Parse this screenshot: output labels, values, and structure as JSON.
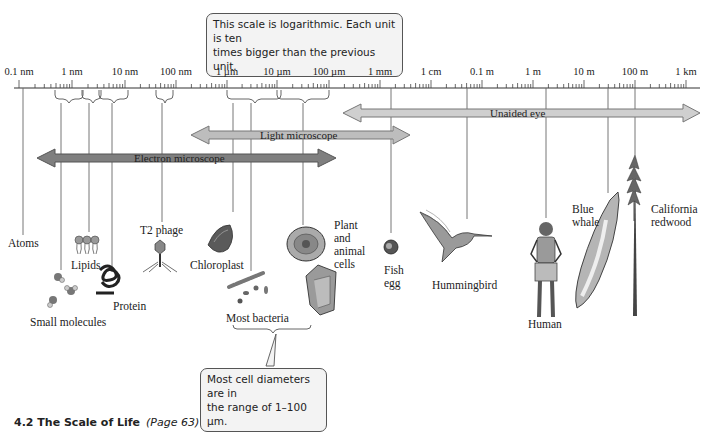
{
  "title_callout": "This scale is logarithmic. Each unit is ten times bigger than the previous unit.",
  "title_callout_lines": [
    "This scale is logarithmic. Each unit is ten",
    "times bigger than the previous unit."
  ],
  "scale": {
    "ticks": [
      {
        "label": "0.1 nm",
        "x": 19
      },
      {
        "label": "1 nm",
        "x": 72
      },
      {
        "label": "10 nm",
        "x": 125
      },
      {
        "label": "100 nm",
        "x": 176
      },
      {
        "label": "1 µm",
        "x": 227
      },
      {
        "label": "10 µm",
        "x": 277
      },
      {
        "label": "100 µm",
        "x": 329
      },
      {
        "label": "1 mm",
        "x": 380
      },
      {
        "label": "1 cm",
        "x": 431
      },
      {
        "label": "0.1 m",
        "x": 482
      },
      {
        "label": "1 m",
        "x": 533
      },
      {
        "label": "10 m",
        "x": 584
      },
      {
        "label": "100 m",
        "x": 635
      },
      {
        "label": "1 km",
        "x": 686
      }
    ]
  },
  "ranges": [
    {
      "label": "Unaided eye",
      "color": "#c8c8c8"
    },
    {
      "label": "Light microscope",
      "color": "#b9b9b9"
    },
    {
      "label": "Electron microscope",
      "color": "#7b7b7b"
    }
  ],
  "objects": [
    {
      "label": "Atoms"
    },
    {
      "label": "Lipids"
    },
    {
      "label": "Small molecules"
    },
    {
      "label": "Protein"
    },
    {
      "label": "T2 phage"
    },
    {
      "label": "Chloroplast"
    },
    {
      "label": "Most bacteria"
    },
    {
      "label": "Plant and animal cells",
      "lines": [
        "Plant",
        "and",
        "animal",
        "cells"
      ]
    },
    {
      "label": "Fish egg",
      "lines": [
        "Fish",
        "egg"
      ]
    },
    {
      "label": "Hummingbird"
    },
    {
      "label": "Human"
    },
    {
      "label": "Blue whale",
      "lines": [
        "Blue",
        "whale"
      ]
    },
    {
      "label": "California redwood",
      "lines": [
        "California",
        "redwood"
      ]
    }
  ],
  "cell_callout_lines": [
    "Most cell diameters are in",
    "the range of 1–100 µm."
  ],
  "cell_callout": "Most cell diameters are in the range of 1–100 µm.",
  "caption": {
    "number_title": "4.2  The Scale of Life",
    "page_ref": "(Page 63)"
  }
}
